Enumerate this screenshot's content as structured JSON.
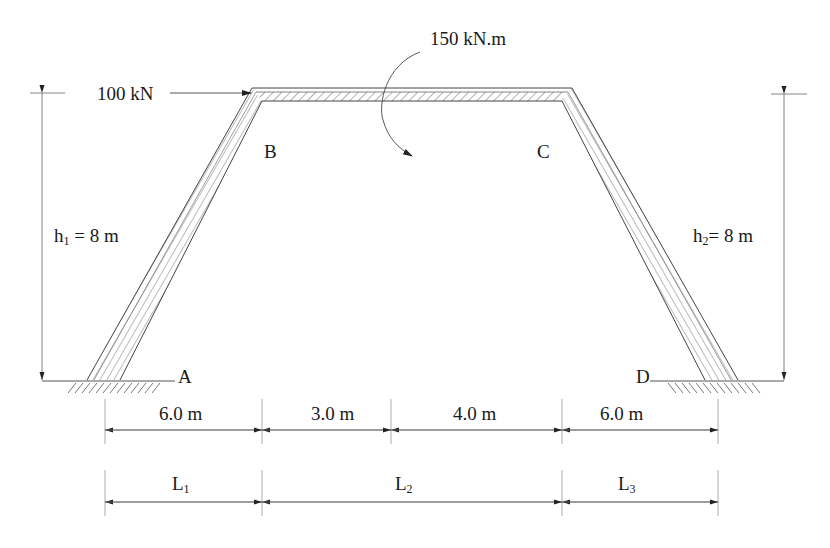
{
  "diagram": {
    "type": "structural-frame",
    "joints": {
      "A": "A",
      "B": "B",
      "C": "C",
      "D": "D"
    },
    "loads": {
      "point_load": "100 kN",
      "moment": "150 kN.m"
    },
    "heights": {
      "h1_var": "h",
      "h1_sub": "1",
      "h1_value": " = 8 m",
      "h2_var": "h",
      "h2_sub": "2",
      "h2_value": "= 8 m"
    },
    "dimensions": {
      "top_row": [
        "6.0 m",
        "3.0 m",
        "4.0 m",
        "6.0 m"
      ],
      "bottom_row": [
        {
          "var": "L",
          "sub": "1"
        },
        {
          "var": "L",
          "sub": "2"
        },
        {
          "var": "L",
          "sub": "3"
        }
      ]
    },
    "colors": {
      "line": "#333333",
      "hatch": "#555555",
      "background": "#ffffff"
    }
  }
}
